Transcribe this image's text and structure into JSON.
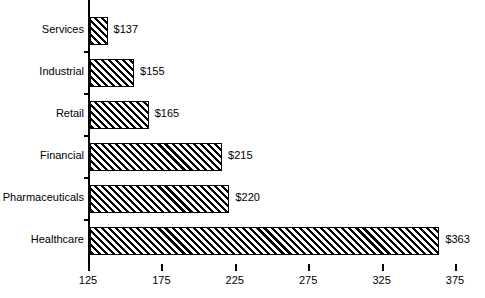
{
  "chart_data": {
    "type": "bar",
    "orientation": "horizontal",
    "title": "",
    "xlabel": "",
    "ylabel": "",
    "categories": [
      "Services",
      "Industrial",
      "Retail",
      "Financial",
      "Pharmaceuticals",
      "Healthcare"
    ],
    "values": [
      137,
      155,
      165,
      215,
      220,
      363
    ],
    "value_labels": [
      "$137",
      "$155",
      "$165",
      "$215",
      "$220",
      "$363"
    ],
    "xlim": [
      125,
      375
    ],
    "xticks": [
      125,
      175,
      225,
      275,
      325,
      375
    ],
    "xtick_labels": [
      "125",
      "175",
      "225",
      "275",
      "325",
      "375"
    ],
    "grid": false,
    "legend": false,
    "bar_style": {
      "fill": "diagonal-hatch",
      "hatch_angle_deg": 45,
      "edge_color": "#000000",
      "face_color": "#ffffff"
    },
    "colors": {
      "background": "#ffffff",
      "axis": "#000000",
      "text": "#000000"
    }
  }
}
